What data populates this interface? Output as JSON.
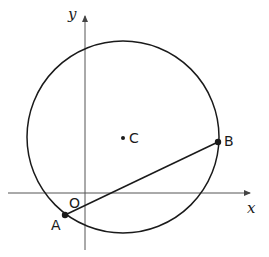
{
  "diagram": {
    "axes": {
      "x_label": "x",
      "y_label": "y",
      "origin_label": "O"
    },
    "circle": {
      "center_label": "C",
      "center": [
        123,
        137
      ],
      "radius": 96
    },
    "points": [
      {
        "label": "A",
        "pos": [
          65,
          215
        ]
      },
      {
        "label": "B",
        "pos": [
          218,
          142
        ]
      }
    ],
    "segments": [
      {
        "from": "A",
        "to": "B"
      }
    ],
    "colors": {
      "stroke": "#1a1a1a",
      "axis": "#555555",
      "background": "#ffffff"
    }
  }
}
